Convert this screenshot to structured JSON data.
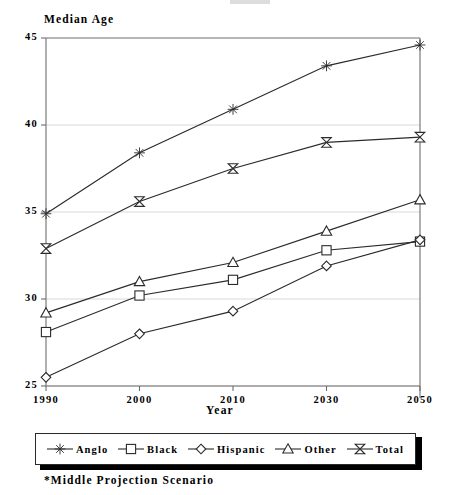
{
  "chart_data": {
    "type": "line",
    "title": "",
    "xlabel": "Year",
    "ylabel": "Median Age",
    "categories": [
      "1990",
      "2000",
      "2010",
      "2030",
      "2050"
    ],
    "ylim": [
      25,
      45
    ],
    "yticks": [
      25,
      30,
      35,
      40,
      45
    ],
    "grid": true,
    "legend_position": "bottom",
    "footnote": "*Middle Projection Scenario",
    "series": [
      {
        "name": "Anglo",
        "marker": "asterisk",
        "values": [
          34.9,
          38.4,
          40.9,
          43.4,
          44.6
        ]
      },
      {
        "name": "Black",
        "marker": "square",
        "values": [
          28.1,
          30.2,
          31.1,
          32.8,
          33.3
        ]
      },
      {
        "name": "Hispanic",
        "marker": "diamond",
        "values": [
          25.5,
          28.0,
          29.3,
          31.9,
          33.4
        ]
      },
      {
        "name": "Other",
        "marker": "triangle",
        "values": [
          29.2,
          31.0,
          32.1,
          33.9,
          35.7
        ]
      },
      {
        "name": "Total",
        "marker": "bowtie",
        "values": [
          32.9,
          35.6,
          37.5,
          39.0,
          39.3
        ]
      }
    ]
  },
  "axes": {
    "y_title": "Median Age",
    "x_title": "Year",
    "y_ticks": [
      "45",
      "40",
      "35",
      "30",
      "25"
    ],
    "x_ticks": [
      "1990",
      "2000",
      "2010",
      "2030",
      "2050"
    ]
  },
  "legend": {
    "items": [
      {
        "label": "Anglo",
        "marker": "asterisk-marker"
      },
      {
        "label": "Black",
        "marker": "square-marker"
      },
      {
        "label": "Hispanic",
        "marker": "diamond-marker"
      },
      {
        "label": "Other",
        "marker": "triangle-marker"
      },
      {
        "label": "Total",
        "marker": "bowtie-marker"
      }
    ]
  },
  "footnote": {
    "text": "*Middle Projection Scenario"
  },
  "colors": {
    "line": "#2b2b2b",
    "axis": "#6e6e6e",
    "grid": "#d8d8d8",
    "text": "#000000",
    "background": "#ffffff"
  }
}
